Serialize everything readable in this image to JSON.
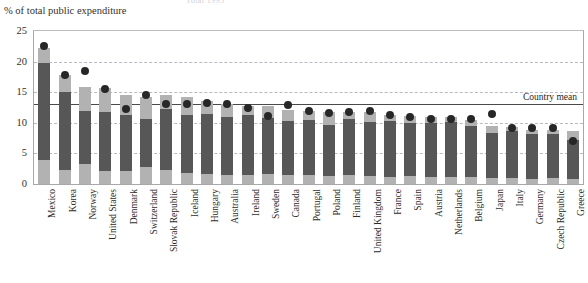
{
  "figure": {
    "top_cut_text": "Total 1995",
    "y_axis_title": "% of total public expenditure",
    "mean_label": "Country mean"
  },
  "chart_data": {
    "type": "bar",
    "title": "",
    "xlabel": "",
    "ylabel": "% of total public expenditure",
    "ylim": [
      0,
      25
    ],
    "yticks": [
      0,
      5,
      10,
      15,
      20,
      25
    ],
    "grid": true,
    "gridlines": [
      5,
      10,
      15,
      20
    ],
    "legend_position": "none",
    "annotations": [
      {
        "label": "Country mean",
        "type": "hline",
        "value": 13.1
      }
    ],
    "country_mean": 13.1,
    "categories": [
      "Mexico",
      "Korea",
      "Norway",
      "United States",
      "Denmark",
      "Switzerland",
      "Slovak Republic",
      "Iceland",
      "Hungary",
      "Australia",
      "Ireland",
      "Sweden",
      "Canada",
      "Portugal",
      "Poland",
      "Finland",
      "United Kingdom",
      "France",
      "Spain",
      "Austria",
      "Netherlands",
      "Belgium",
      "Japan",
      "Italy",
      "Germany",
      "Czech Republic",
      "Greece"
    ],
    "series": [
      {
        "name": "lower segment",
        "color": "#b2b2b2",
        "values": [
          4.0,
          2.3,
          3.3,
          2.1,
          2.2,
          2.7,
          2.3,
          1.8,
          1.6,
          1.5,
          1.4,
          1.6,
          1.5,
          1.5,
          1.3,
          1.4,
          1.3,
          1.1,
          1.3,
          1.2,
          1.1,
          1.1,
          1.0,
          1.0,
          0.9,
          1.0,
          0.8
        ]
      },
      {
        "name": "middle segment",
        "color": "#575757",
        "values": [
          15.8,
          12.7,
          8.7,
          9.7,
          9.1,
          8.0,
          9.9,
          9.4,
          9.9,
          9.4,
          9.9,
          9.2,
          8.8,
          8.9,
          8.3,
          9.2,
          8.8,
          9.2,
          8.6,
          8.7,
          9.0,
          8.4,
          7.4,
          7.6,
          7.3,
          7.2,
          6.4
        ]
      },
      {
        "name": "upper segment",
        "color": "#b2b2b2",
        "values": [
          2.4,
          2.8,
          3.8,
          3.9,
          3.3,
          3.6,
          2.4,
          3.1,
          2.0,
          2.1,
          1.5,
          1.9,
          1.8,
          1.5,
          2.2,
          1.2,
          1.6,
          1.0,
          1.2,
          1.0,
          0.8,
          1.0,
          1.1,
          0.7,
          0.7,
          0.6,
          1.5
        ]
      }
    ],
    "totals": [
      22.2,
      17.8,
      15.8,
      15.7,
      14.6,
      14.3,
      14.6,
      14.3,
      13.5,
      13.0,
      12.8,
      12.7,
      12.1,
      11.9,
      11.8,
      11.8,
      11.7,
      11.3,
      11.1,
      10.9,
      10.9,
      10.5,
      9.5,
      9.3,
      8.9,
      8.8,
      8.7
    ],
    "markers": {
      "name": "Country dot",
      "color": "#272727",
      "values": [
        22.6,
        17.8,
        18.5,
        15.5,
        12.3,
        14.6,
        13.1,
        13.0,
        13.2,
        13.0,
        12.4,
        11.1,
        12.9,
        11.9,
        11.6,
        11.7,
        11.9,
        11.3,
        10.9,
        10.7,
        10.6,
        10.6,
        11.4,
        9.2,
        9.2,
        9.2,
        7.1
      ]
    }
  }
}
